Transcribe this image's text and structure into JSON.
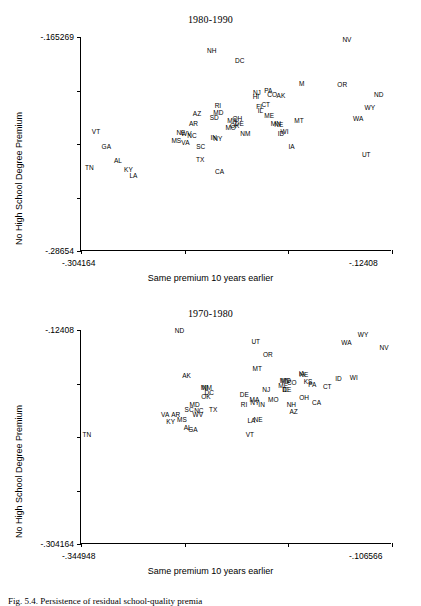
{
  "figure": {
    "caption": "Fig. 5.4.  Persistence of residual school-quality premia"
  },
  "chart_data": [
    {
      "type": "scatter",
      "title": "1980-1990",
      "xlabel": "Same premium 10 years earlier",
      "ylabel": "No High School Degree Premium",
      "xlim": [
        -0.304164,
        -0.12408
      ],
      "ylim": [
        -0.28654,
        -0.165269
      ],
      "xticklabels": [
        "-.304164",
        "-.12408"
      ],
      "yticklabels": [
        "-.165269",
        "-.28654"
      ],
      "grid": false,
      "legend": "none",
      "point_label_field": "state",
      "points": [
        {
          "state": "NV",
          "x": -0.1502,
          "y": -0.167
        },
        {
          "state": "NH",
          "x": -0.2285,
          "y": -0.1733
        },
        {
          "state": "DC",
          "x": -0.2122,
          "y": -0.1788
        },
        {
          "state": "OR",
          "x": -0.1529,
          "y": -0.1925
        },
        {
          "state": "M",
          "x": -0.1763,
          "y": -0.192
        },
        {
          "state": "PA",
          "x": -0.1957,
          "y": -0.1958
        },
        {
          "state": "NJ",
          "x": -0.2023,
          "y": -0.1971
        },
        {
          "state": "CO",
          "x": -0.1935,
          "y": -0.1981
        },
        {
          "state": "AK",
          "x": -0.1884,
          "y": -0.1986
        },
        {
          "state": "HI",
          "x": -0.2029,
          "y": -0.1993
        },
        {
          "state": "ND",
          "x": -0.1318,
          "y": -0.1984
        },
        {
          "state": "CT",
          "x": -0.1972,
          "y": -0.2038
        },
        {
          "state": "FL",
          "x": -0.2005,
          "y": -0.2049
        },
        {
          "state": "IL",
          "x": -0.2003,
          "y": -0.2073
        },
        {
          "state": "RI",
          "x": -0.2249,
          "y": -0.2045
        },
        {
          "state": "WY",
          "x": -0.1369,
          "y": -0.2053
        },
        {
          "state": "MD",
          "x": -0.2246,
          "y": -0.2083
        },
        {
          "state": "AZ",
          "x": -0.237,
          "y": -0.2089
        },
        {
          "state": "ME",
          "x": -0.1952,
          "y": -0.2098
        },
        {
          "state": "SD",
          "x": -0.227,
          "y": -0.2113
        },
        {
          "state": "WA",
          "x": -0.1437,
          "y": -0.2119
        },
        {
          "state": "MA",
          "x": -0.2166,
          "y": -0.2128
        },
        {
          "state": "OH",
          "x": -0.2136,
          "y": -0.212
        },
        {
          "state": "DE",
          "x": -0.2125,
          "y": -0.2148
        },
        {
          "state": "OK",
          "x": -0.2152,
          "y": -0.2155
        },
        {
          "state": "AR",
          "x": -0.239,
          "y": -0.2146
        },
        {
          "state": "MT",
          "x": -0.1779,
          "y": -0.2128
        },
        {
          "state": "MN",
          "x": -0.1913,
          "y": -0.2145
        },
        {
          "state": "NE",
          "x": -0.1896,
          "y": -0.2152
        },
        {
          "state": "MO",
          "x": -0.2175,
          "y": -0.2171
        },
        {
          "state": "VT",
          "x": -0.2955,
          "y": -0.219
        },
        {
          "state": "WV",
          "x": -0.2432,
          "y": -0.22
        },
        {
          "state": "NE",
          "x": -0.2463,
          "y": -0.2196
        },
        {
          "state": "NM",
          "x": -0.209,
          "y": -0.22
        },
        {
          "state": "ID",
          "x": -0.1884,
          "y": -0.22
        },
        {
          "state": "WI",
          "x": -0.1863,
          "y": -0.2193
        },
        {
          "state": "NC",
          "x": -0.2399,
          "y": -0.2212
        },
        {
          "state": "IN",
          "x": -0.2273,
          "y": -0.2224
        },
        {
          "state": "NY",
          "x": -0.225,
          "y": -0.2232
        },
        {
          "state": "MS",
          "x": -0.249,
          "y": -0.2243
        },
        {
          "state": "VA",
          "x": -0.2437,
          "y": -0.2256
        },
        {
          "state": "SC",
          "x": -0.2348,
          "y": -0.2277
        },
        {
          "state": "GA",
          "x": -0.2895,
          "y": -0.2276
        },
        {
          "state": "IA",
          "x": -0.1822,
          "y": -0.2275
        },
        {
          "state": "UT",
          "x": -0.139,
          "y": -0.232
        },
        {
          "state": "AL",
          "x": -0.2828,
          "y": -0.2356
        },
        {
          "state": "TX",
          "x": -0.2352,
          "y": -0.2351
        },
        {
          "state": "KY",
          "x": -0.2767,
          "y": -0.2404
        },
        {
          "state": "TN",
          "x": -0.2993,
          "y": -0.2397
        },
        {
          "state": "CA",
          "x": -0.2239,
          "y": -0.2418
        },
        {
          "state": "LA",
          "x": -0.2738,
          "y": -0.2441
        }
      ]
    },
    {
      "type": "scatter",
      "title": "1970-1980",
      "xlabel": "Same premium 10 years earlier",
      "ylabel": "No High School Degree Premium",
      "xlim": [
        -0.344948,
        -0.106566
      ],
      "ylim": [
        -0.304164,
        -0.12408
      ],
      "xticklabels": [
        "-.344948",
        "-.106566"
      ],
      "yticklabels": [
        "-.12408",
        "-.304164"
      ],
      "grid": false,
      "legend": "none",
      "point_label_field": "state",
      "points": [
        {
          "state": "ND",
          "x": -0.2695,
          "y": -0.1253
        },
        {
          "state": "WY",
          "x": -0.1288,
          "y": -0.1286
        },
        {
          "state": "UT",
          "x": -0.211,
          "y": -0.1338
        },
        {
          "state": "WA",
          "x": -0.1415,
          "y": -0.135
        },
        {
          "state": "NV",
          "x": -0.1127,
          "y": -0.1393
        },
        {
          "state": "OR",
          "x": -0.2018,
          "y": -0.1455
        },
        {
          "state": "MT",
          "x": -0.2099,
          "y": -0.1568
        },
        {
          "state": "IA",
          "x": -0.1757,
          "y": -0.161
        },
        {
          "state": "NE",
          "x": -0.1742,
          "y": -0.1623
        },
        {
          "state": "AK",
          "x": -0.264,
          "y": -0.1625
        },
        {
          "state": "ID",
          "x": -0.1476,
          "y": -0.1655
        },
        {
          "state": "WI",
          "x": -0.1359,
          "y": -0.1648
        },
        {
          "state": "MN",
          "x": -0.1888,
          "y": -0.1668
        },
        {
          "state": "MD",
          "x": -0.1878,
          "y": -0.1673
        },
        {
          "state": "CO",
          "x": -0.1834,
          "y": -0.1688
        },
        {
          "state": "KS",
          "x": -0.1709,
          "y": -0.1676
        },
        {
          "state": "PA",
          "x": -0.1676,
          "y": -0.1704
        },
        {
          "state": "ME",
          "x": -0.19,
          "y": -0.1711
        },
        {
          "state": "CT",
          "x": -0.1562,
          "y": -0.1722
        },
        {
          "state": "MI",
          "x": -0.2504,
          "y": -0.1726
        },
        {
          "state": "NM",
          "x": -0.2484,
          "y": -0.1733
        },
        {
          "state": "NJ",
          "x": -0.203,
          "y": -0.1742
        },
        {
          "state": "IL",
          "x": -0.1885,
          "y": -0.1748
        },
        {
          "state": "DE",
          "x": -0.1872,
          "y": -0.1744
        },
        {
          "state": "DC",
          "x": -0.2466,
          "y": -0.1772
        },
        {
          "state": "DE",
          "x": -0.2198,
          "y": -0.179
        },
        {
          "state": "OK",
          "x": -0.2492,
          "y": -0.1808
        },
        {
          "state": "OH",
          "x": -0.174,
          "y": -0.1812
        },
        {
          "state": "MA",
          "x": -0.212,
          "y": -0.1826
        },
        {
          "state": "MO",
          "x": -0.1976,
          "y": -0.1826
        },
        {
          "state": "NY",
          "x": -0.2118,
          "y": -0.1855
        },
        {
          "state": "CA",
          "x": -0.1644,
          "y": -0.1855
        },
        {
          "state": "MD",
          "x": -0.2579,
          "y": -0.187
        },
        {
          "state": "IN",
          "x": -0.2065,
          "y": -0.1872
        },
        {
          "state": "NH",
          "x": -0.1837,
          "y": -0.187
        },
        {
          "state": "RI",
          "x": -0.22,
          "y": -0.1874
        },
        {
          "state": "SC",
          "x": -0.2621,
          "y": -0.1915
        },
        {
          "state": "NC",
          "x": -0.2546,
          "y": -0.1926
        },
        {
          "state": "TX",
          "x": -0.2437,
          "y": -0.191
        },
        {
          "state": "AZ",
          "x": -0.182,
          "y": -0.1933
        },
        {
          "state": "VA",
          "x": -0.2804,
          "y": -0.196
        },
        {
          "state": "AR",
          "x": -0.2723,
          "y": -0.1958
        },
        {
          "state": "WV",
          "x": -0.2554,
          "y": -0.196
        },
        {
          "state": "LA",
          "x": -0.2143,
          "y": -0.201
        },
        {
          "state": "NE",
          "x": -0.2092,
          "y": -0.1998
        },
        {
          "state": "MS",
          "x": -0.2676,
          "y": -0.1995
        },
        {
          "state": "KY",
          "x": -0.2762,
          "y": -0.2018
        },
        {
          "state": "AL",
          "x": -0.2632,
          "y": -0.2063
        },
        {
          "state": "GA",
          "x": -0.2592,
          "y": -0.2085
        },
        {
          "state": "VT",
          "x": -0.2155,
          "y": -0.2125
        },
        {
          "state": "TN",
          "x": -0.3405,
          "y": -0.2128
        }
      ]
    }
  ]
}
